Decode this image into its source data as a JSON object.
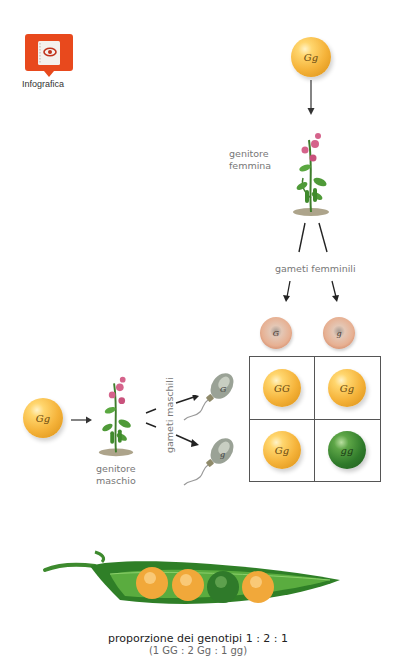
{
  "badge": {
    "label": "Infografica",
    "icon": "book-eye-icon",
    "color": "#e8491d"
  },
  "parents": {
    "female": {
      "genotype": "Gg",
      "label_line1": "genitore",
      "label_line2": "femmina"
    },
    "male": {
      "genotype": "Gg",
      "label_line1": "genitore",
      "label_line2": "maschio"
    }
  },
  "gametes": {
    "female_label": "gameti femminili",
    "male_label": "gameti maschili",
    "female": [
      "G",
      "g"
    ],
    "male": [
      "G",
      "g"
    ]
  },
  "punnett": {
    "cells": [
      {
        "genotype": "GG",
        "color": "yellow"
      },
      {
        "genotype": "Gg",
        "color": "yellow"
      },
      {
        "genotype": "Gg",
        "color": "yellow"
      },
      {
        "genotype": "gg",
        "color": "green"
      }
    ]
  },
  "pod": {
    "peas": [
      "yellow",
      "yellow",
      "green",
      "yellow"
    ]
  },
  "caption": {
    "line1": "proporzione dei genotipi 1 : 2 : 1",
    "line2": "(1 GG : 2 Gg : 1 gg)"
  },
  "colors": {
    "yellow": "#f5b33a",
    "green": "#2f7a2a",
    "egg": "#e7b092",
    "badge": "#e8491d"
  }
}
